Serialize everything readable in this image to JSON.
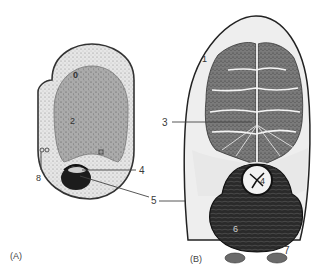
{
  "figure": {
    "type": "anatomical cross-section illustration",
    "panels": [
      {
        "id": "A",
        "panel_label": "(A)",
        "labels": [
          {
            "key": "label_0",
            "text": "0"
          },
          {
            "key": "label_2",
            "text": "2"
          },
          {
            "key": "label_4",
            "text": "4"
          },
          {
            "key": "label_5",
            "text": "5"
          },
          {
            "key": "label_8",
            "text": "8"
          }
        ]
      },
      {
        "id": "B",
        "panel_label": "(B)",
        "labels": [
          {
            "key": "label_1",
            "text": "1"
          },
          {
            "key": "label_3",
            "text": "3"
          },
          {
            "key": "label_4",
            "text": "4"
          },
          {
            "key": "label_6",
            "text": "6"
          },
          {
            "key": "label_7",
            "text": "7"
          }
        ]
      }
    ],
    "colors": {
      "outline": "#222222",
      "cortex_light": "#e4e4e4",
      "core_gray": "#a8a8a8",
      "dark_mass": "#1c1c1c",
      "lobule": "#6e6e6e",
      "leader_line": "#444444"
    }
  },
  "panelA": {
    "panel_label": "(A)",
    "l0": "0",
    "l2": "2",
    "l4": "4",
    "l5": "5",
    "l8": "8"
  },
  "panelB": {
    "panel_label": "(B)",
    "l1": "1",
    "l3": "3",
    "l4": "4",
    "l6": "6",
    "l7": "7"
  }
}
